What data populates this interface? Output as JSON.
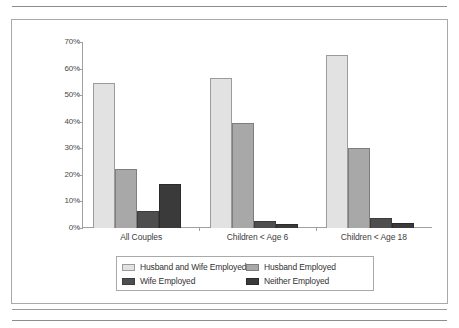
{
  "chart_data": {
    "type": "bar",
    "title": "",
    "xlabel": "",
    "ylabel": "",
    "ylim": [
      0,
      70
    ],
    "grid": false,
    "legend_position": "bottom",
    "categories": [
      "All Couples",
      "Children < Age 6",
      "Children < Age 18"
    ],
    "y_ticks": [
      "0%",
      "10%",
      "20%",
      "30%",
      "40%",
      "50%",
      "60%",
      "70%"
    ],
    "y_tick_values": [
      0,
      10,
      20,
      30,
      40,
      50,
      60,
      70
    ],
    "series": [
      {
        "name": "Husband and Wife Employed",
        "color": "#e2e2e2",
        "values": [
          54.5,
          56.6,
          65.0
        ]
      },
      {
        "name": "Husband Employed",
        "color": "#a8a8a8",
        "values": [
          22.3,
          39.4,
          30.0
        ]
      },
      {
        "name": "Wife Employed",
        "color": "#4e4e4e",
        "values": [
          6.5,
          2.7,
          3.6
        ]
      },
      {
        "name": "Neither Employed",
        "color": "#3a3a3a",
        "values": [
          16.5,
          1.4,
          2.0
        ]
      }
    ]
  },
  "legend": {
    "entries": [
      {
        "label": "Husband and Wife Employed",
        "swatch": "s0"
      },
      {
        "label": "Husband Employed",
        "swatch": "s1"
      },
      {
        "label": "Wife Employed",
        "swatch": "s2"
      },
      {
        "label": "Neither Employed",
        "swatch": "s3"
      }
    ]
  }
}
